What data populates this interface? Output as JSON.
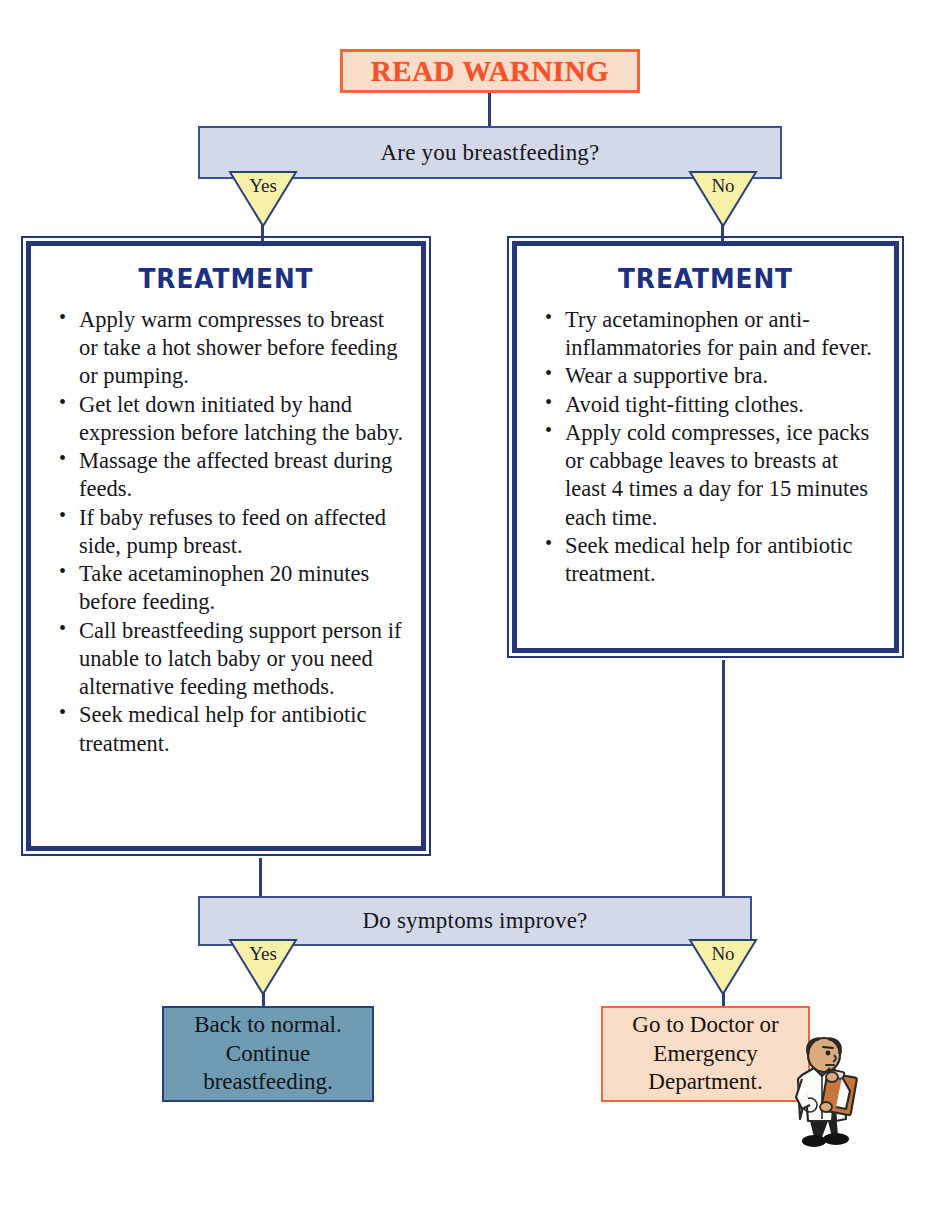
{
  "diagram": {
    "title_banner": {
      "label": "READ WARNING"
    },
    "questions": {
      "breastfeeding": "Are you breastfeeding?",
      "improve": "Do symptoms improve?"
    },
    "branches": {
      "yes": "Yes",
      "no": "No"
    },
    "treatment_left": {
      "heading": "TREATMENT",
      "items": [
        "Apply warm compresses to breast or take a hot shower before feeding or pumping.",
        "Get let down initiated by hand expression before latching the baby.",
        "Massage the affected breast during feeds.",
        "If baby refuses to feed on affected side, pump breast.",
        "Take acetaminophen 20 minutes before feeding.",
        "Call breastfeeding support person if unable to latch baby or you need alternative feeding methods.",
        "Seek medical help for antibiotic treatment."
      ]
    },
    "treatment_right": {
      "heading": "TREATMENT",
      "items": [
        "Try acetaminophen or anti-inflammatories for pain and fever.",
        "Wear a supportive bra.",
        "Avoid tight-fitting clothes.",
        "Apply cold compresses, ice packs or cabbage leaves to breasts at least 4 times a day for 15 minutes each time.",
        "Seek medical help for antibiotic treatment."
      ]
    },
    "outcomes": {
      "normal": "Back to normal. Continue breastfeeding.",
      "doctor": "Go to Doctor or Emergency Department."
    },
    "icons": {
      "doctor": "doctor-with-clipboard-icon"
    },
    "colors": {
      "warning_fill": "#f9ddcb",
      "warning_border": "#f0673a",
      "warning_text": "#f4522a",
      "question_fill": "#d3d9e9",
      "question_border": "#3c5190",
      "branch_fill": "#f7f0a8",
      "branch_border": "#2b3f7a",
      "treatment_border": "#26367a",
      "treatment_heading": "#1d3082",
      "outcome_normal_fill": "#6f9cb2",
      "outcome_doctor_fill": "#f9ddc6",
      "connector": "#2b3f7a"
    }
  }
}
